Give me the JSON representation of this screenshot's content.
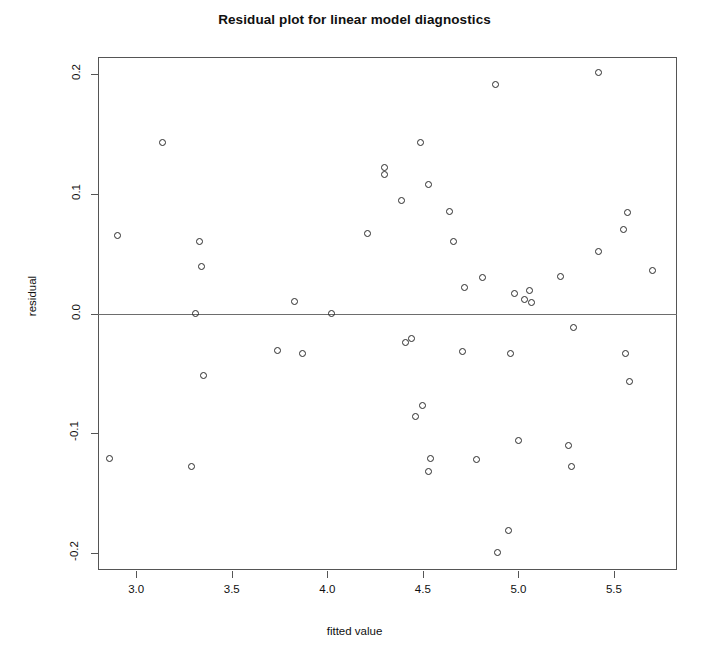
{
  "chart_data": {
    "type": "scatter",
    "title": "Residual plot for linear model diagnostics",
    "xlabel": "fitted value",
    "ylabel": "residual",
    "xlim": [
      2.8,
      5.83
    ],
    "ylim": [
      -0.214,
      0.214
    ],
    "xticks": [
      "3.0",
      "3.5",
      "4.0",
      "4.5",
      "5.0",
      "5.5"
    ],
    "xtick_values": [
      3.0,
      3.5,
      4.0,
      4.5,
      5.0,
      5.5
    ],
    "yticks": [
      "0.2",
      "0.1",
      "0.0",
      "-0.1",
      "-0.2"
    ],
    "ytick_values": [
      0.2,
      0.1,
      0.0,
      -0.1,
      -0.2
    ],
    "grid": false,
    "legend": false,
    "reference_line": {
      "orientation": "horizontal",
      "y": 0.0,
      "color": "#6d6d6d"
    },
    "marker": {
      "shape": "open-circle",
      "color": "#2b2b2b",
      "size": 7
    },
    "n_points": 48,
    "x": [
      2.86,
      2.9,
      3.14,
      3.29,
      3.33,
      3.34,
      3.35,
      3.74,
      3.82,
      3.86,
      3.97,
      4.02,
      4.21,
      4.3,
      4.3,
      4.39,
      4.41,
      4.44,
      4.46,
      4.49,
      4.52,
      4.53,
      4.54,
      4.55,
      4.57,
      4.63,
      4.7,
      4.73,
      4.74,
      4.75,
      4.77,
      4.88,
      4.9,
      4.92,
      4.97,
      4.98,
      5.01,
      5.03,
      5.05,
      5.06,
      5.09,
      5.18,
      5.27,
      5.28,
      5.3,
      5.42,
      5.44,
      5.55,
      5.57,
      5.58,
      5.7
    ],
    "y": [
      -0.121,
      0.065,
      0.143,
      -0.128,
      0.06,
      0.039,
      -0.052,
      -0.031,
      0.01,
      -0.033,
      0.0,
      0.0,
      0.067,
      0.122,
      0.116,
      0.094,
      -0.024,
      -0.021,
      0.143,
      -0.086,
      -0.077,
      0.108,
      -0.121,
      -0.132,
      -0.032,
      0.085,
      0.022,
      0.06,
      -0.122,
      0.03,
      -0.015,
      0.191,
      -0.199,
      -0.181,
      -0.033,
      0.017,
      0.012,
      0.019,
      0.009,
      -0.106,
      -0.004,
      0.031,
      -0.11,
      -0.128,
      -0.012,
      0.201,
      0.052,
      0.07,
      -0.033,
      0.084,
      -0.057,
      0.036
    ],
    "points": [
      {
        "x": 2.86,
        "y": -0.121
      },
      {
        "x": 2.9,
        "y": 0.065
      },
      {
        "x": 3.14,
        "y": 0.143
      },
      {
        "x": 3.29,
        "y": -0.128
      },
      {
        "x": 3.33,
        "y": 0.06
      },
      {
        "x": 3.34,
        "y": 0.039
      },
      {
        "x": 3.35,
        "y": -0.052
      },
      {
        "x": 3.31,
        "y": 0.0
      },
      {
        "x": 3.74,
        "y": -0.031
      },
      {
        "x": 3.83,
        "y": 0.01
      },
      {
        "x": 3.87,
        "y": -0.033
      },
      {
        "x": 4.02,
        "y": 0.0
      },
      {
        "x": 4.21,
        "y": 0.067
      },
      {
        "x": 4.3,
        "y": 0.122
      },
      {
        "x": 4.3,
        "y": 0.116
      },
      {
        "x": 4.39,
        "y": 0.094
      },
      {
        "x": 4.41,
        "y": -0.024
      },
      {
        "x": 4.44,
        "y": -0.021
      },
      {
        "x": 4.49,
        "y": 0.143
      },
      {
        "x": 4.46,
        "y": -0.086
      },
      {
        "x": 4.5,
        "y": -0.077
      },
      {
        "x": 4.53,
        "y": 0.108
      },
      {
        "x": 4.54,
        "y": -0.121
      },
      {
        "x": 4.53,
        "y": -0.132
      },
      {
        "x": 4.71,
        "y": -0.032
      },
      {
        "x": 4.64,
        "y": 0.085
      },
      {
        "x": 4.72,
        "y": 0.022
      },
      {
        "x": 4.66,
        "y": 0.06
      },
      {
        "x": 4.78,
        "y": -0.122
      },
      {
        "x": 4.81,
        "y": 0.03
      },
      {
        "x": 4.88,
        "y": 0.191
      },
      {
        "x": 4.89,
        "y": -0.199
      },
      {
        "x": 4.95,
        "y": -0.181
      },
      {
        "x": 4.96,
        "y": -0.033
      },
      {
        "x": 4.98,
        "y": 0.017
      },
      {
        "x": 5.03,
        "y": 0.012
      },
      {
        "x": 5.06,
        "y": 0.019
      },
      {
        "x": 5.07,
        "y": 0.009
      },
      {
        "x": 5.0,
        "y": -0.106
      },
      {
        "x": 5.22,
        "y": 0.031
      },
      {
        "x": 5.26,
        "y": -0.11
      },
      {
        "x": 5.28,
        "y": -0.128
      },
      {
        "x": 5.29,
        "y": -0.012
      },
      {
        "x": 5.42,
        "y": 0.201
      },
      {
        "x": 5.42,
        "y": 0.052
      },
      {
        "x": 5.55,
        "y": 0.07
      },
      {
        "x": 5.56,
        "y": -0.033
      },
      {
        "x": 5.57,
        "y": 0.084
      },
      {
        "x": 5.58,
        "y": -0.057
      },
      {
        "x": 5.7,
        "y": 0.036
      }
    ]
  }
}
